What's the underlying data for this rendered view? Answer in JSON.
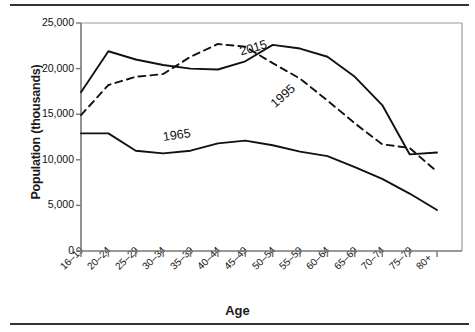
{
  "figure": {
    "y_axis_title": "Population (thousands)",
    "x_axis_title": "Age"
  },
  "chart_data": {
    "type": "line",
    "title": "",
    "xlabel": "Age",
    "ylabel": "Population (thousands)",
    "categories": [
      "16–19",
      "20–24",
      "25–29",
      "30–34",
      "35–39",
      "40–44",
      "45–49",
      "50–54",
      "55–59",
      "60–64",
      "65–69",
      "70–74",
      "75–79",
      "80+"
    ],
    "ylim": [
      0,
      25000
    ],
    "xlim_categories": 14,
    "yticks": [
      0,
      5000,
      10000,
      15000,
      20000,
      25000
    ],
    "ytick_labels": [
      "0",
      "5,000",
      "10,000",
      "15,000",
      "20,000",
      "25,000"
    ],
    "grid": false,
    "legend": "inline-annotations",
    "series": [
      {
        "name": "2015",
        "style": "solid",
        "color": "#111111",
        "label_position": "above-line-near-50-54",
        "values": [
          17400,
          21900,
          21000,
          20400,
          20000,
          19900,
          20800,
          22600,
          22200,
          21300,
          19100,
          16000,
          10600,
          10800
        ]
      },
      {
        "name": "1995",
        "style": "dashed",
        "color": "#111111",
        "label_position": "along-descending-segment-55-59",
        "values": [
          14900,
          18200,
          19100,
          19400,
          21300,
          22700,
          22400,
          20600,
          18900,
          16500,
          14000,
          11700,
          11300,
          8700
        ]
      },
      {
        "name": "1965",
        "style": "solid",
        "color": "#111111",
        "label_position": "above-line-near-35-39",
        "values": [
          12900,
          12900,
          11000,
          10700,
          11000,
          11800,
          12100,
          11600,
          10900,
          10400,
          9200,
          7900,
          6300,
          4500
        ]
      }
    ],
    "series_annotation_labels": [
      "2015",
      "1995",
      "1965"
    ]
  }
}
